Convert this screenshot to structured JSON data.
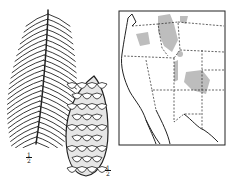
{
  "figure": {
    "branch": {
      "subject": "conifer branch with needles",
      "scale": {
        "num": "1",
        "den": "2"
      }
    },
    "cone": {
      "subject": "spruce cone",
      "scale": {
        "num": "1",
        "den": "2"
      }
    },
    "map": {
      "subject": "range map of western United States",
      "range_color": "#bdbdbd",
      "border_color": "#222222"
    }
  }
}
